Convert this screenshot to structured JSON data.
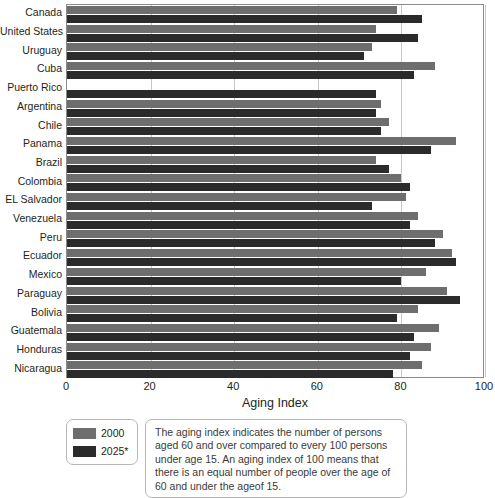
{
  "chart_data": {
    "type": "bar",
    "orientation": "horizontal",
    "title": "",
    "xlabel": "Aging Index",
    "ylabel": "",
    "xlim": [
      0,
      100
    ],
    "xticks": [
      0,
      20,
      40,
      60,
      80,
      100
    ],
    "grid": true,
    "legend_position": "bottom-left",
    "categories": [
      "Canada",
      "United States",
      "Uruguay",
      "Cuba",
      "Puerto Rico",
      "Argentina",
      "Chile",
      "Panama",
      "Brazil",
      "Colombia",
      "EL Salvador",
      "Venezuela",
      "Peru",
      "Ecuador",
      "Mexico",
      "Paraguay",
      "Bolivia",
      "Guatemala",
      "Honduras",
      "Nicaragua"
    ],
    "series": [
      {
        "name": "2000",
        "color": "#6e6e6e",
        "values": [
          79,
          74,
          73,
          88,
          0,
          75,
          77,
          93,
          74,
          80,
          81,
          84,
          90,
          92,
          86,
          91,
          84,
          89,
          87,
          85
        ]
      },
      {
        "name": "2025*",
        "color": "#2b2b2b",
        "values": [
          85,
          84,
          71,
          83,
          74,
          74,
          75,
          87,
          77,
          82,
          73,
          82,
          88,
          93,
          80,
          94,
          79,
          83,
          82,
          78
        ]
      }
    ]
  },
  "axis": {
    "x_title": "Aging Index",
    "tick_labels": [
      "0",
      "20",
      "40",
      "60",
      "80",
      "100"
    ]
  },
  "legend": {
    "items": [
      {
        "label": "2000",
        "color": "#6e6e6e"
      },
      {
        "label": "2025*",
        "color": "#2b2b2b"
      }
    ]
  },
  "caption": {
    "text": "The aging index indicates the number of persons aged 60 and over compared to every 100 persons under age 15. An aging index of 100 means that there is an equal number of people over the age of 60 and under the ageof 15."
  }
}
